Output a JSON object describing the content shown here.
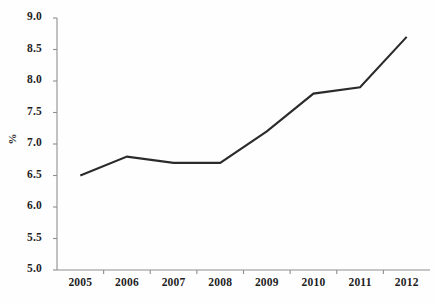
{
  "chart_data": {
    "type": "line",
    "title": "",
    "subtitle": "",
    "xlabel": "",
    "ylabel": "%",
    "categories": [
      "2005",
      "2006",
      "2007",
      "2008",
      "2009",
      "2010",
      "2011",
      "2012"
    ],
    "values": [
      6.5,
      6.8,
      6.7,
      6.7,
      7.2,
      7.8,
      7.9,
      8.7
    ],
    "series": [
      {
        "name": "",
        "values": [
          6.5,
          6.8,
          6.7,
          6.7,
          7.2,
          7.8,
          7.9,
          8.7
        ]
      }
    ],
    "ylim": [
      5.0,
      9.0
    ],
    "ytick_labels": [
      "9.0",
      "8.5",
      "8.0",
      "7.5",
      "7.0",
      "6.5",
      "6.0",
      "5.5",
      "5.0"
    ],
    "ytick_values": [
      9.0,
      8.5,
      8.0,
      7.5,
      7.0,
      6.5,
      6.0,
      5.5,
      5.0
    ],
    "xtick_labels": [
      "2005",
      "2006",
      "2007",
      "2008",
      "2009",
      "2010",
      "2011",
      "2012"
    ],
    "grid": false,
    "legend": false,
    "legend_position": "none",
    "line_color": "#2b2b2b",
    "axis_color": "#8e8e8e",
    "background_color": "#fefefe",
    "markers": false,
    "annotations": []
  }
}
